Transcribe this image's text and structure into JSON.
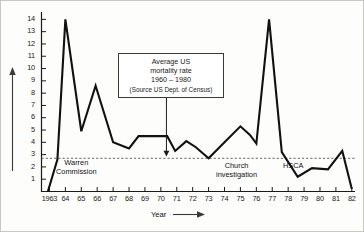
{
  "figure": {
    "background": "#fdfdfb",
    "border_color": "#c9c9c4",
    "line_color": "#111111",
    "axis_color": "#1a1a1a",
    "reference_line_color": "#555555"
  },
  "axis_title_x": "Year",
  "y_arrow_name": "y-axis-arrow",
  "x_arrow_name": "x-axis-arrow",
  "annotation_box": {
    "line1": "Average US",
    "line2": "mortality rate",
    "line3": "1960 – 1980",
    "line4": "(Source US Dept. of Census)"
  },
  "notes": [
    {
      "id": "warren",
      "line1": "Warren",
      "line2": "Commission",
      "x": 55,
      "y": 157
    },
    {
      "id": "church",
      "line1": "Church",
      "line2": "investigation",
      "x": 215,
      "y": 160
    },
    {
      "id": "hsca",
      "line1": "HSCA",
      "line2": "",
      "x": 282,
      "y": 160
    }
  ],
  "chart_data": {
    "type": "line",
    "title": "",
    "xlabel": "Year",
    "ylabel": "",
    "xlim": [
      1962.5,
      1982.2
    ],
    "ylim": [
      0,
      14.6
    ],
    "grid": false,
    "legend": "none",
    "y_ticks": [
      1,
      2,
      3,
      4,
      5,
      6,
      7,
      8,
      9,
      10,
      11,
      12,
      13,
      14
    ],
    "x_ticks": [
      1963,
      1964,
      1965,
      1966,
      1967,
      1968,
      1969,
      1970,
      1971,
      1972,
      1973,
      1974,
      1975,
      1976,
      1977,
      1978,
      1979,
      1980,
      1981,
      1982
    ],
    "x_tick_labels": [
      "1963",
      "64",
      "65",
      "66",
      "67",
      "68",
      "69",
      "70",
      "71",
      "72",
      "73",
      "74",
      "75",
      "76",
      "77",
      "78",
      "79",
      "80",
      "81",
      "82"
    ],
    "reference_line": {
      "label": "Average US mortality rate 1960 – 1980",
      "value": 2.7,
      "style": "dashed"
    },
    "series": [
      {
        "name": "deaths",
        "x": [
          1962.9,
          1963.5,
          1964.0,
          1965.0,
          1965.9,
          1967.0,
          1968.0,
          1968.6,
          1969.6,
          1970.4,
          1970.9,
          1971.6,
          1972.2,
          1973.0,
          1974.0,
          1975.0,
          1975.6,
          1976.0,
          1976.8,
          1977.6,
          1978.6,
          1979.5,
          1980.5,
          1981.4,
          1982.0
        ],
        "values": [
          0.0,
          2.6,
          14.0,
          4.9,
          8.6,
          4.0,
          3.5,
          4.5,
          4.5,
          4.5,
          3.3,
          4.1,
          3.6,
          2.7,
          4.0,
          5.3,
          4.6,
          3.9,
          14.0,
          3.2,
          1.2,
          1.9,
          1.8,
          3.3,
          0.2
        ]
      }
    ],
    "annotation_pointer": {
      "from_x": 1970.35,
      "from_y": 8.6,
      "to_x": 1970.35,
      "to_y": 2.85
    }
  }
}
